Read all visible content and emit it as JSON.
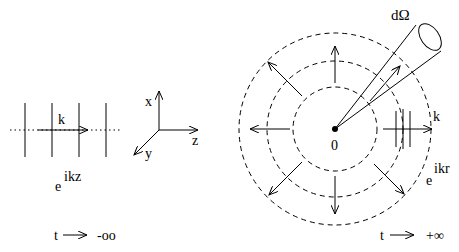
{
  "left_panel": {
    "wave_vector_label": "k",
    "plane_wave_base": "e",
    "plane_wave_exponent": "ikz",
    "time_label": "t",
    "time_limit": "-oo",
    "axes": {
      "x": "x",
      "y": "y",
      "z": "z"
    }
  },
  "right_panel": {
    "solid_angle_label": "dΩ",
    "origin_label": "0",
    "wave_vector_label": "k",
    "spherical_wave_base": "e",
    "spherical_wave_exponent": "ikr",
    "time_label": "t",
    "time_limit": "+∞"
  },
  "colors": {
    "ink": "#000000",
    "background": "#ffffff"
  }
}
